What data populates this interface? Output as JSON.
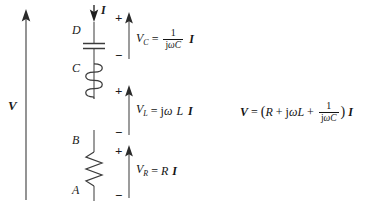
{
  "diagram": {
    "background_color": "#ffffff",
    "line_color": "#4a4a4a",
    "text_color": "#1a1a1a",
    "source_arrow": {
      "label": "V",
      "direction": "up",
      "name": "source-voltage-arrow"
    },
    "current_arrow": {
      "label": "I",
      "direction": "down",
      "name": "current-arrow"
    },
    "nodes": [
      {
        "label": "D",
        "name": "node-d"
      },
      {
        "label": "C",
        "name": "node-c"
      },
      {
        "label": "B",
        "name": "node-b"
      },
      {
        "label": "A",
        "name": "node-a"
      }
    ],
    "components": [
      {
        "type": "capacitor",
        "name": "capacitor-symbol"
      },
      {
        "type": "inductor",
        "name": "inductor-symbol"
      },
      {
        "type": "resistor",
        "name": "resistor-symbol"
      }
    ],
    "polarity_plus": "+",
    "polarity_minus": "−"
  },
  "equations": {
    "capacitor": {
      "name": "capacitor-voltage-equation",
      "lhs_symbol": "V",
      "lhs_subscript": "C",
      "equals": "=",
      "numerator": "1",
      "denominator_j": "j",
      "denominator_omega": "ω",
      "denominator_c": "C",
      "current": "I"
    },
    "inductor": {
      "name": "inductor-voltage-equation",
      "lhs_symbol": "V",
      "lhs_subscript": "L",
      "equals": "=",
      "rhs_j": "j",
      "rhs_omega": "ω",
      "rhs_l": "L",
      "current": "I"
    },
    "resistor": {
      "name": "resistor-voltage-equation",
      "lhs_symbol": "V",
      "lhs_subscript": "R",
      "equals": "=",
      "rhs_r": "R",
      "current": "I"
    },
    "total": {
      "name": "total-voltage-equation",
      "lhs_symbol": "V",
      "equals": "=",
      "open_paren": "(",
      "term_r": "R",
      "plus_1": "+",
      "term_j": "j",
      "term_omega": "ω",
      "term_l": "L",
      "plus_2": "+",
      "numerator": "1",
      "denominator_j": "j",
      "denominator_omega": "ω",
      "denominator_c": "C",
      "close_paren": ")",
      "current": "I"
    }
  }
}
